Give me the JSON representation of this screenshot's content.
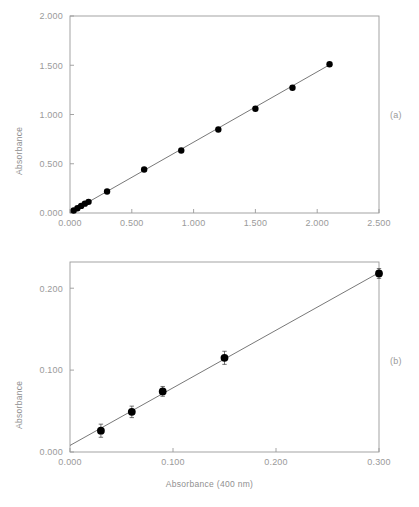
{
  "figure": {
    "xaxis_title": "Absorbance (400 nm)",
    "yaxis_title": "Absorbance",
    "panel_a_letter": "(a)",
    "panel_b_letter": "(b)",
    "line_color": "#555555",
    "marker_color": "#000000",
    "axis_color": "#9a9a9a",
    "background": "#ffffff"
  },
  "chart_data": [
    {
      "type": "scatter",
      "panel": "(a)",
      "title": "",
      "xlabel": "Absorbance (400 nm)",
      "ylabel": "Absorbance",
      "xlim": [
        0.0,
        2.5
      ],
      "ylim": [
        0.0,
        2.0
      ],
      "xticks": [
        0.0,
        0.5,
        1.0,
        1.5,
        2.0,
        2.5
      ],
      "xticklabels": [
        "0.000",
        "0.500",
        "1.000",
        "1.500",
        "2.000",
        "2.500"
      ],
      "yticks": [
        0.0,
        0.5,
        1.0,
        1.5,
        2.0
      ],
      "yticklabels": [
        "0.000",
        "0.500",
        "1.000",
        "1.500",
        "2.000"
      ],
      "grid": false,
      "legend": false,
      "errorbars": false,
      "series": [
        {
          "name": "calibration",
          "x": [
            0.03,
            0.06,
            0.09,
            0.12,
            0.15,
            0.3,
            0.6,
            0.9,
            1.2,
            1.5,
            1.8,
            2.1
          ],
          "y": [
            0.025,
            0.048,
            0.072,
            0.095,
            0.113,
            0.218,
            0.442,
            0.635,
            0.848,
            1.058,
            1.272,
            1.51
          ]
        }
      ],
      "fit_line": {
        "x": [
          0.0,
          2.12
        ],
        "y": [
          0.005,
          1.519
        ]
      }
    },
    {
      "type": "scatter",
      "panel": "(b)",
      "title": "",
      "xlabel": "Absorbance (400 nm)",
      "ylabel": "Absorbance",
      "xlim": [
        0.0,
        0.3
      ],
      "ylim": [
        0.0,
        0.232
      ],
      "xticks": [
        0.0,
        0.1,
        0.2,
        0.3
      ],
      "xticklabels": [
        "0.000",
        "0.100",
        "0.200",
        "0.300"
      ],
      "yticks": [
        0.0,
        0.1,
        0.2
      ],
      "yticklabels": [
        "0.000",
        "0.100",
        "0.200"
      ],
      "grid": false,
      "legend": false,
      "errorbars": true,
      "series": [
        {
          "name": "calibration-expanded",
          "x": [
            0.03,
            0.06,
            0.09,
            0.15,
            0.3
          ],
          "y": [
            0.026,
            0.049,
            0.074,
            0.115,
            0.218
          ],
          "yerr": [
            0.008,
            0.007,
            0.006,
            0.008,
            0.006
          ]
        }
      ],
      "fit_line": {
        "x": [
          0.0,
          0.3
        ],
        "y": [
          0.008,
          0.219
        ]
      }
    }
  ]
}
